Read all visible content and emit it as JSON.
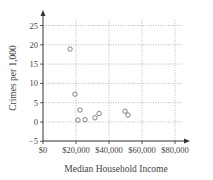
{
  "chart_data": {
    "type": "scatter",
    "title": "",
    "xlabel": "Median Household Income",
    "ylabel": "Crimes per 1,000",
    "xlim": [
      0,
      85000
    ],
    "ylim": [
      -5,
      28
    ],
    "grid": true,
    "x_ticks": [
      0,
      20000,
      40000,
      60000,
      80000
    ],
    "x_tick_labels": [
      "$0",
      "$20,000",
      "$40,000",
      "$60,000",
      "$80,000"
    ],
    "y_ticks": [
      -5,
      0,
      5,
      10,
      15,
      20,
      25
    ],
    "y_tick_labels": [
      "−5",
      "0",
      "5",
      "10",
      "15",
      "20",
      "25"
    ],
    "marker": "open-circle",
    "points": [
      {
        "x": 16400,
        "y": 18.9
      },
      {
        "x": 19400,
        "y": 7.2
      },
      {
        "x": 22400,
        "y": 3.1
      },
      {
        "x": 21200,
        "y": 0.5
      },
      {
        "x": 25500,
        "y": 0.6
      },
      {
        "x": 31500,
        "y": 1.1
      },
      {
        "x": 34000,
        "y": 2.2
      },
      {
        "x": 49700,
        "y": 2.8
      },
      {
        "x": 51500,
        "y": 1.8
      }
    ]
  },
  "colors": {
    "axis": "#333333",
    "grid": "#9a9a9a",
    "marker": "#666666"
  }
}
